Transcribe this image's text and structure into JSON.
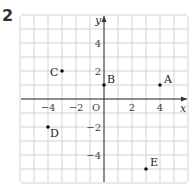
{
  "question_number": "2",
  "chart_data": {
    "type": "scatter",
    "title": "",
    "xlabel": "x",
    "ylabel": "y",
    "xlim": [
      -6,
      6
    ],
    "ylim": [
      -6,
      6
    ],
    "grid": true,
    "origin_label": "O",
    "x_ticks": [
      -4,
      -2,
      2,
      4
    ],
    "y_ticks": [
      4,
      2,
      -2,
      -4
    ],
    "points": [
      {
        "label": "A",
        "x": 4,
        "y": 1
      },
      {
        "label": "B",
        "x": 0,
        "y": 1
      },
      {
        "label": "C",
        "x": -3,
        "y": 2
      },
      {
        "label": "D",
        "x": -4,
        "y": -2
      },
      {
        "label": "E",
        "x": 3,
        "y": -5
      }
    ]
  }
}
